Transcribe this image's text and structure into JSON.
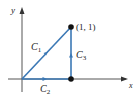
{
  "diagram": {
    "axes": {
      "x_label": "x",
      "y_label": "y"
    },
    "point_label": "(1, 1)",
    "curves": [
      {
        "name": "C",
        "sub": "1",
        "from": "(0, 0)",
        "to": "(1, 1)"
      },
      {
        "name": "C",
        "sub": "2",
        "from": "(0, 0)",
        "to": "(1, 0)"
      },
      {
        "name": "C",
        "sub": "3",
        "from": "(1, 0)",
        "to": "(1, 1)"
      }
    ],
    "colors": {
      "curve": "#3b78b5",
      "axis": "#555555",
      "point": "#111111"
    }
  }
}
